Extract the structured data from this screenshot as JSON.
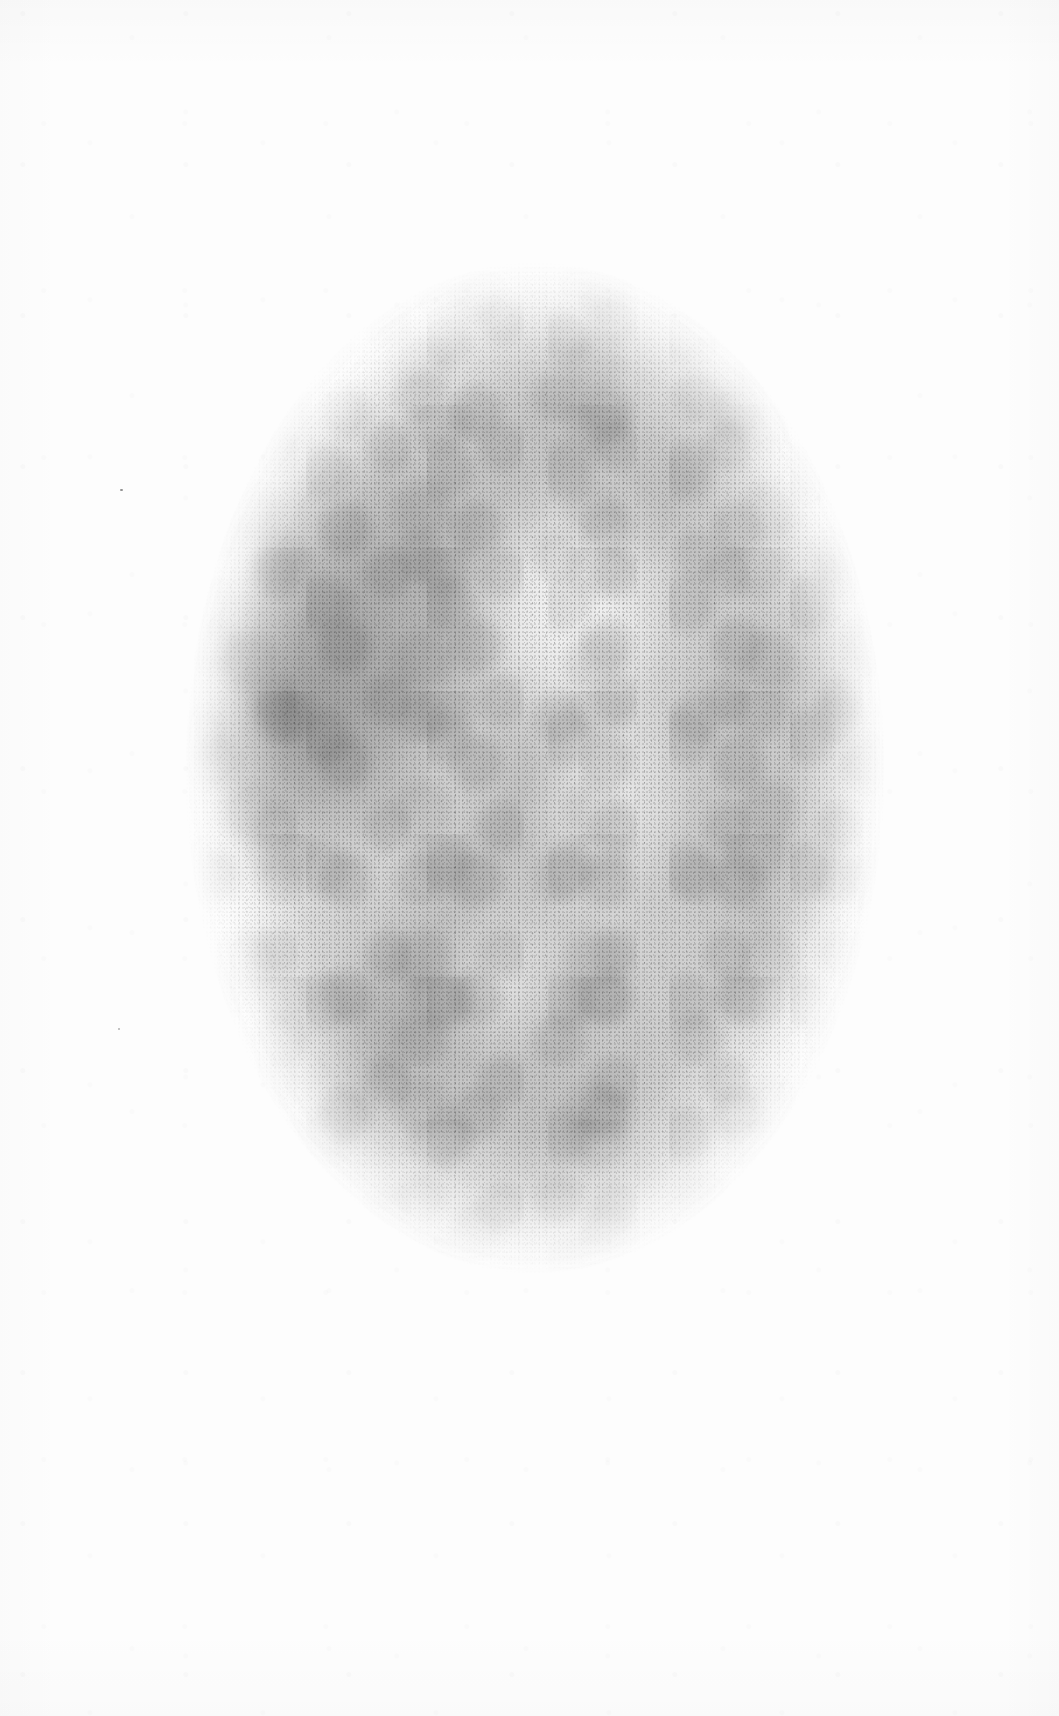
{
  "document": {
    "kind": "faded-oval-portrait-print",
    "medium": "stipple / mezzotint engraving",
    "support": "aged white wove paper",
    "caption": "",
    "title": "",
    "inscription": "",
    "plate_mark": "",
    "signature": "",
    "page_number": ""
  },
  "canvas": {
    "width_px": 1059,
    "height_px": 1716,
    "paper_color": "#fdfdfd",
    "margin_color": "#ffffff"
  },
  "plate": {
    "shape": "oval",
    "left_px": 185,
    "top_px": 262,
    "width_px": 700,
    "height_px": 1012,
    "orientation": "portrait",
    "edge": "soft / vignetted, no ruled border",
    "ink_color": "#6c6c6c",
    "darkest_tone": "#d8d8d8",
    "lightest_tone": "#fefefe",
    "overall_density": "very faint"
  },
  "tonal_regions": [
    {
      "name": "hair-mass-upper-left",
      "position": "24% 33%",
      "tone": "darkest"
    },
    {
      "name": "hair-mass-left-lower",
      "position": "16% 47%",
      "tone": "dark"
    },
    {
      "name": "crown-shading",
      "position": "56% 14%",
      "tone": "mid"
    },
    {
      "name": "right-side-shading",
      "position": "88% 42%",
      "tone": "mid"
    },
    {
      "name": "right-lower-shading",
      "position": "82% 64%",
      "tone": "mid-light"
    },
    {
      "name": "drapery-lower",
      "position": "52% 86%",
      "tone": "mid"
    },
    {
      "name": "drapery-lower-left",
      "position": "26% 74%",
      "tone": "mid-light"
    },
    {
      "name": "face-highlight",
      "position": "56% 35%",
      "tone": "lightest"
    },
    {
      "name": "neck-highlight",
      "position": "60% 52%",
      "tone": "light"
    },
    {
      "name": "chest-highlight",
      "position": "45% 71%",
      "tone": "light"
    },
    {
      "name": "shoulder-contour",
      "position": "66% 62%",
      "tone": "edge-line"
    }
  ],
  "margins": {
    "top_blank_px": 262,
    "bottom_blank_px": 442,
    "left_blank_px": 185,
    "right_blank_px": 174,
    "text_present": false
  },
  "paper_flaws": [
    {
      "name": "speck-left-margin-upper",
      "x_px": 120,
      "y_px": 489
    },
    {
      "name": "speck-left-margin-lower",
      "x_px": 118,
      "y_px": 1028
    }
  ]
}
